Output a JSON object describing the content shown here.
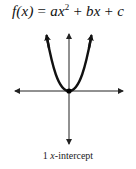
{
  "title": {
    "lhs": "f(x)",
    "eq": " = ",
    "a": "ax",
    "exp": "2",
    "plus1": " + ",
    "b": "bx",
    "plus2": " + ",
    "c": "c"
  },
  "graph": {
    "curve": "parabola opening upward",
    "vertex": "on x-axis at origin",
    "x_intercepts": 1,
    "colors": {
      "axis": "#222222",
      "curve": "#111111",
      "point": "#000000"
    }
  },
  "caption": {
    "count": "1",
    "var": "x",
    "rest": "-intercept"
  }
}
